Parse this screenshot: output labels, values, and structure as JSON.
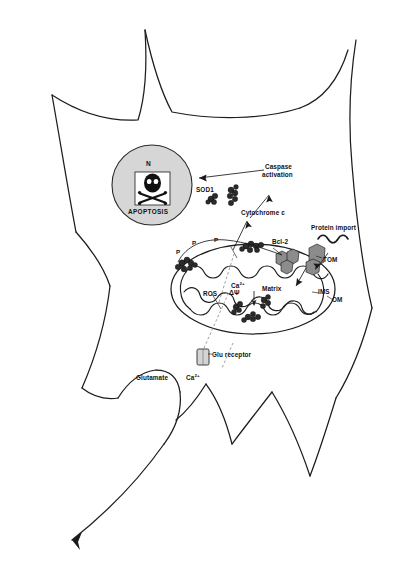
{
  "figure": {
    "background_color": "#ffffff",
    "ink_color": "#1a1a1a",
    "nucleus_fill": "#d6d6d6",
    "aggregate_fill": "#2b2b2b",
    "complex_fill": "#8c8c8c"
  },
  "nucleus": {
    "marker": "N",
    "apoptosis_label": "APOPTOSIS",
    "icon": "skull-and-crossbones"
  },
  "labels": {
    "sod1": "SOD1",
    "caspase_activation_line1": "Caspase",
    "caspase_activation_line2": "activation",
    "cytochrome_c": "Cytochrome c",
    "protein_import": "Protein import",
    "bcl2": "Bcl-2",
    "tom": "TOM",
    "ims": "IMS",
    "om": "OM",
    "matrix": "Matrix",
    "ros": "ROS",
    "calcium_matrix": "Ca",
    "calcium_matrix_sup": "2+",
    "membrane_potential": "ΔΨ",
    "glu_receptor": "Glu receptor",
    "glutamate": "Glutamate",
    "calcium_extracell": "Ca",
    "calcium_extracell_sup": "2+",
    "phospho_1": "P",
    "phospho_2": "P",
    "phospho_3": "P"
  },
  "structures": [
    {
      "name": "cell-membrane",
      "kind": "outline",
      "shape": "stellate-neuron"
    },
    {
      "name": "nucleus",
      "kind": "organelle"
    },
    {
      "name": "mitochondrion",
      "kind": "organelle"
    },
    {
      "name": "sod1-aggregates",
      "kind": "protein-aggregate"
    },
    {
      "name": "tom-complex",
      "kind": "membrane-complex"
    },
    {
      "name": "bcl2-complex",
      "kind": "membrane-complex"
    },
    {
      "name": "glutamate-receptor",
      "kind": "membrane-channel"
    }
  ],
  "flows": [
    {
      "name": "cytochrome-c-release",
      "from": "mitochondrion",
      "to": "cytosol"
    },
    {
      "name": "caspase-activation",
      "from": "cytochrome c",
      "to": "caspase activation"
    },
    {
      "name": "apoptosis-signal",
      "from": "caspase activation",
      "to": "nucleus"
    },
    {
      "name": "calcium-influx",
      "from": "Glu receptor",
      "to": "Matrix"
    },
    {
      "name": "protein-import-route",
      "from": "Protein import",
      "to": "TOM"
    }
  ]
}
